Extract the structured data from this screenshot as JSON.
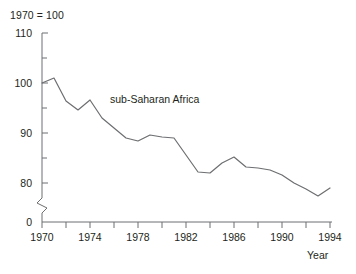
{
  "chart_data": {
    "type": "line",
    "title": "",
    "subtitle": "",
    "index_note": "1970 = 100",
    "xlabel": "Year",
    "ylabel": "",
    "grid": false,
    "legend_position": "inline-annotation",
    "xlim": [
      1970,
      1994
    ],
    "ylim": [
      78,
      110
    ],
    "y_axis_break": true,
    "y_zero_label": "0",
    "x_ticks_major": [
      1970,
      1974,
      1978,
      1982,
      1986,
      1990,
      1994
    ],
    "x_ticks_major_labels": [
      "1970",
      "1974",
      "1978",
      "1982",
      "1986",
      "1990",
      "1994"
    ],
    "x_ticks_minor": [
      1972,
      1976,
      1980,
      1984,
      1988,
      1992
    ],
    "y_ticks_major": [
      80,
      90,
      100,
      110
    ],
    "y_ticks_major_labels": [
      "80",
      "90",
      "100",
      "110"
    ],
    "y_ticks_minor": [
      85,
      95,
      105
    ],
    "series": [
      {
        "name": "sub-Saharan Africa",
        "color": "#6d6e71",
        "annotation_label": "sub-Saharan Africa",
        "x": [
          1970,
          1971,
          1972,
          1973,
          1974,
          1975,
          1976,
          1977,
          1978,
          1979,
          1980,
          1981,
          1982,
          1983,
          1984,
          1985,
          1986,
          1987,
          1988,
          1989,
          1990,
          1991,
          1992,
          1993,
          1994
        ],
        "values": [
          100.0,
          101.0,
          96.4,
          94.6,
          96.6,
          93.0,
          91.0,
          89.0,
          88.4,
          89.6,
          89.2,
          89.0,
          85.6,
          82.2,
          82.0,
          84.0,
          85.2,
          83.2,
          83.0,
          82.6,
          81.6,
          80.0,
          78.8,
          77.4,
          79.0
        ]
      }
    ]
  },
  "axis": {
    "y_labels": [
      "110",
      "100",
      "90",
      "80",
      "0"
    ],
    "x_labels": [
      "1970",
      "1974",
      "1978",
      "1982",
      "1986",
      "1990",
      "1994"
    ],
    "x_title": "Year",
    "index_note": "1970 = 100"
  },
  "annotations": {
    "series_label": "sub-Saharan Africa"
  },
  "colors": {
    "line": "#6d6e71",
    "axis": "#6d6e71",
    "text": "#231f20",
    "background": "#ffffff"
  }
}
